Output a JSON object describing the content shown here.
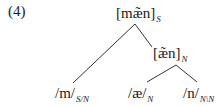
{
  "example_number": "(4)",
  "tree": {
    "root": {
      "text": "[mæ̃n]",
      "category": "S"
    },
    "mid": {
      "text": "[æ̃n]",
      "category": "N"
    },
    "leaves": [
      {
        "text": "/m/",
        "category": "S/N"
      },
      {
        "text": "/æ/",
        "category": "N"
      },
      {
        "text": "/n/",
        "category": "N\\N"
      }
    ],
    "edges": [
      {
        "from": "root",
        "to": "leaf-m"
      },
      {
        "from": "root",
        "to": "mid"
      },
      {
        "from": "mid",
        "to": "leaf-ae"
      },
      {
        "from": "mid",
        "to": "leaf-n"
      }
    ]
  }
}
